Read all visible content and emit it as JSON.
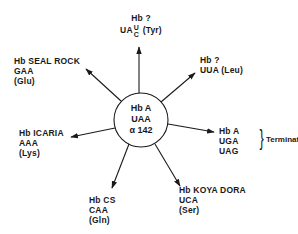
{
  "diagram": {
    "title": "",
    "center": {
      "line1": "Hb A",
      "line2": "UAA",
      "line3": "α 142"
    },
    "branches": [
      {
        "id": "top",
        "name": "Hb ?",
        "codon_prefix": "UA",
        "codon_alt_top": "U",
        "codon_alt_bottom": "C",
        "amino_acid": "(Tyr)"
      },
      {
        "id": "upper-right",
        "name": "Hb ?",
        "codon": "UUA",
        "amino_acid": "(Leu)"
      },
      {
        "id": "right",
        "name": "Hb A",
        "codons": [
          "UGA",
          "UAG"
        ],
        "result": "Terminate"
      },
      {
        "id": "lower-right",
        "name": "Hb KOYA DORA",
        "codon": "UCA",
        "amino_acid": "(Ser)"
      },
      {
        "id": "bottom",
        "name": "Hb CS",
        "codon": "CAA",
        "amino_acid": "(Gln)"
      },
      {
        "id": "left",
        "name": "Hb ICARIA",
        "codon": "AAA",
        "amino_acid": "(Lys)"
      },
      {
        "id": "upper-left",
        "name": "Hb SEAL ROCK",
        "codon": "GAA",
        "amino_acid": "(Glu)"
      }
    ],
    "colors": {
      "ink": "#1a1a1a",
      "background": "#ffffff"
    }
  }
}
